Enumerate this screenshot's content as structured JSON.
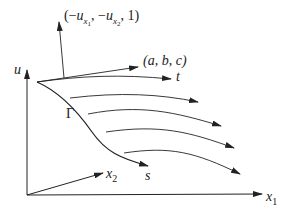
{
  "diagram": {
    "axes": {
      "u_label": "u",
      "x1_label": "x",
      "x1_sub": "1",
      "x2_label": "x",
      "x2_sub": "2"
    },
    "curve_label": "Γ",
    "curve_param_label": "s",
    "tangent_t_label": "t",
    "vector_abc_label": "(a, b, c)",
    "normal_label": {
      "open": "(−",
      "u1": "u",
      "sub1_x": "x",
      "sub1_n": "1",
      "sep": ", −",
      "u2": "u",
      "sub2_x": "x",
      "sub2_n": "2",
      "close": ", 1)"
    },
    "colors": {
      "stroke": "#222222",
      "background": "#ffffff"
    },
    "characteristic_curves_count": 4
  }
}
